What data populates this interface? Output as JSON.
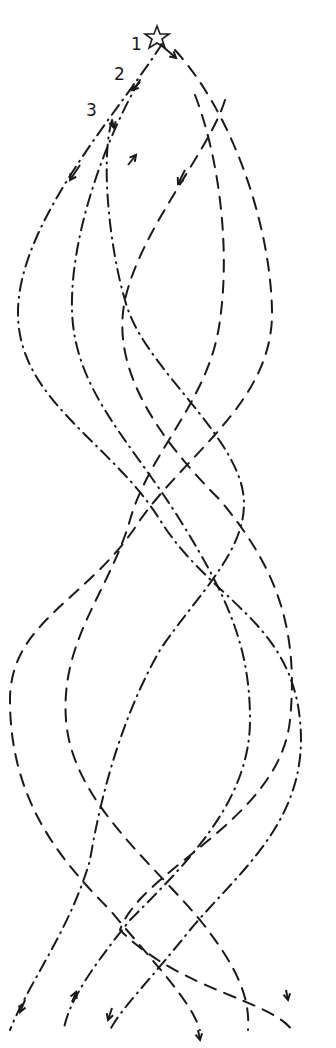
{
  "diagram": {
    "title": "",
    "start_marker": "star-icon",
    "labels": [
      {
        "id": "1",
        "text": "1"
      },
      {
        "id": "2",
        "text": "2"
      },
      {
        "id": "3",
        "text": "3"
      }
    ],
    "strands": [
      {
        "name": "strand-dashed-a",
        "style": "dashed"
      },
      {
        "name": "strand-dashdot-a",
        "style": "dash-dot"
      },
      {
        "name": "strand-dashed-b",
        "style": "dashed"
      },
      {
        "name": "strand-dashdot-b",
        "style": "dash-dot"
      },
      {
        "name": "strand-dashed-c",
        "style": "dashed"
      },
      {
        "name": "strand-dashdot-c",
        "style": "dash-dot"
      }
    ],
    "ink_color": "#1a1a1a"
  }
}
